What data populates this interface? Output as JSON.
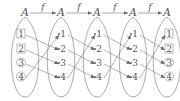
{
  "diagram": {
    "type": "iterated-function-mapping",
    "set_label": "A",
    "function_label": "f",
    "stroke_color": "#8a8a8a",
    "text_color": "#555555",
    "columns": [
      {
        "label": "A",
        "cx": 25,
        "nodes": [
          {
            "label": "1",
            "marker": "square"
          },
          {
            "label": "2",
            "marker": "square"
          },
          {
            "label": "3",
            "marker": "circle"
          },
          {
            "label": "4",
            "marker": "circle"
          }
        ]
      },
      {
        "label": "A",
        "cx": 61,
        "nodes": [
          {
            "label": "1",
            "marker": "dot"
          },
          {
            "label": "2",
            "marker": "dot"
          },
          {
            "label": "3",
            "marker": "dot"
          },
          {
            "label": "4",
            "marker": "dot"
          }
        ]
      },
      {
        "label": "A",
        "cx": 97,
        "nodes": [
          {
            "label": "1",
            "marker": "dot"
          },
          {
            "label": "2",
            "marker": "dot"
          },
          {
            "label": "3",
            "marker": "dot"
          },
          {
            "label": "4",
            "marker": "dot"
          }
        ]
      },
      {
        "label": "A",
        "cx": 133,
        "nodes": [
          {
            "label": "1",
            "marker": "dot"
          },
          {
            "label": "2",
            "marker": "dot"
          },
          {
            "label": "3",
            "marker": "dot"
          },
          {
            "label": "4",
            "marker": "dot"
          }
        ]
      },
      {
        "label": "A",
        "cx": 167,
        "nodes": [
          {
            "label": "1",
            "marker": "square"
          },
          {
            "label": "2",
            "marker": "square"
          },
          {
            "label": "3",
            "marker": "circle"
          },
          {
            "label": "4",
            "marker": "circle"
          }
        ]
      }
    ],
    "top_arrows": [
      {
        "from": 0,
        "to": 1,
        "label": "f"
      },
      {
        "from": 1,
        "to": 2,
        "label": "f"
      },
      {
        "from": 2,
        "to": 3,
        "label": "f"
      },
      {
        "from": 3,
        "to": 4,
        "label": "f"
      }
    ],
    "mapping": {
      "1": "2",
      "2": "3",
      "3": "4",
      "4": "1"
    }
  }
}
